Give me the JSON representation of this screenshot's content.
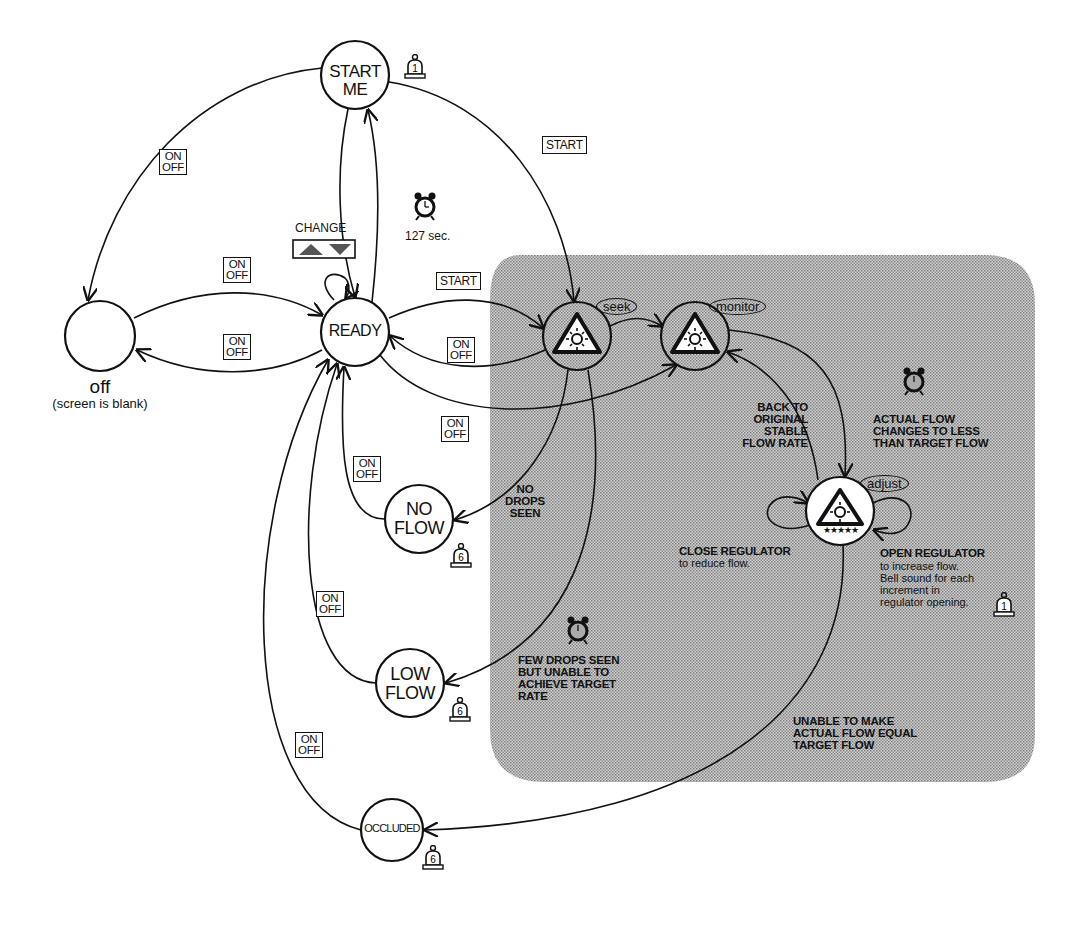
{
  "diagram": {
    "region": {
      "name": "active-control-region",
      "fill": "#bdbdbd"
    },
    "states": [
      {
        "id": "off",
        "label": "",
        "caption": "off",
        "subcaption": "(screen is blank)",
        "cx": 100,
        "cy": 336,
        "r": 35
      },
      {
        "id": "start_me",
        "label": "START\nME",
        "cx": 355,
        "cy": 75,
        "r": 34,
        "alarm": "1"
      },
      {
        "id": "ready",
        "label": "READY",
        "cx": 355,
        "cy": 332,
        "r": 34
      },
      {
        "id": "seek",
        "label": "",
        "tag": "seek",
        "cx": 577,
        "cy": 336,
        "r": 34,
        "icon": "light-triangle"
      },
      {
        "id": "monitor",
        "label": "",
        "tag": "monitor",
        "cx": 695,
        "cy": 336,
        "r": 34,
        "icon": "light-triangle"
      },
      {
        "id": "adjust",
        "label": "",
        "tag": "adjust",
        "cx": 840,
        "cy": 511,
        "r": 34,
        "icon": "light-triangle-stars",
        "stars": "★★★★★"
      },
      {
        "id": "no_flow",
        "label": "NO\nFLOW",
        "cx": 419,
        "cy": 519,
        "r": 34,
        "alarm": "6"
      },
      {
        "id": "low_flow",
        "label": "LOW\nFLOW",
        "cx": 410,
        "cy": 683,
        "r": 34,
        "alarm": "6"
      },
      {
        "id": "occluded",
        "label": "OCCLUDED",
        "cx": 392,
        "cy": 830,
        "r": 31,
        "alarm": "6"
      }
    ],
    "button_labels": {
      "on_off_top": "ON",
      "on_off_bottom": "OFF",
      "start": "START",
      "change": "CHANGE"
    },
    "timer": {
      "label": "127 sec."
    },
    "notes": {
      "no_drops": "NO\nDROPS\nSEEN",
      "few_drops": "FEW DROPS SEEN\nBUT UNABLE TO\nACHIEVE TARGET\nRATE",
      "back_to_original": "BACK TO\nORIGINAL\nSTABLE\nFLOW RATE",
      "actual_flow_changes": "ACTUAL FLOW\nCHANGES TO LESS\nTHAN TARGET FLOW",
      "close_regulator_title": "CLOSE REGULATOR",
      "close_regulator_body": "to reduce flow.",
      "open_regulator_title": "OPEN REGULATOR",
      "open_regulator_body": "to increase flow.\nBell sound for each\nincrement in\nregulator opening.",
      "unable_to_make": "UNABLE TO MAKE\nACTUAL FLOW EQUAL\nTARGET FLOW"
    },
    "alarm_counts": {
      "start_me": "1",
      "no_flow": "6",
      "low_flow": "6",
      "occluded": "6",
      "open_regulator": "1"
    },
    "transitions": [
      {
        "from": "start_me",
        "to": "off",
        "label": "ON/OFF"
      },
      {
        "from": "off",
        "to": "ready",
        "label": "ON/OFF"
      },
      {
        "from": "ready",
        "to": "off",
        "label": "ON/OFF"
      },
      {
        "from": "ready",
        "to": "ready",
        "label": "CHANGE"
      },
      {
        "from": "ready",
        "to": "start_me",
        "label": "127 sec."
      },
      {
        "from": "start_me",
        "to": "ready",
        "label": ""
      },
      {
        "from": "start_me",
        "to": "seek",
        "label": "START"
      },
      {
        "from": "ready",
        "to": "seek",
        "label": "START"
      },
      {
        "from": "seek",
        "to": "ready",
        "label": "ON/OFF"
      },
      {
        "from": "seek",
        "to": "monitor",
        "label": ""
      },
      {
        "from": "ready",
        "to": "monitor",
        "label": "ON/OFF"
      },
      {
        "from": "seek",
        "to": "no_flow",
        "label": "NO DROPS SEEN"
      },
      {
        "from": "seek",
        "to": "low_flow",
        "label": "FEW DROPS SEEN BUT UNABLE TO ACHIEVE TARGET RATE"
      },
      {
        "from": "no_flow",
        "to": "ready",
        "label": "ON/OFF"
      },
      {
        "from": "low_flow",
        "to": "ready",
        "label": "ON/OFF"
      },
      {
        "from": "occluded",
        "to": "ready",
        "label": "ON/OFF"
      },
      {
        "from": "monitor",
        "to": "adjust",
        "label": "ACTUAL FLOW CHANGES TO LESS THAN TARGET FLOW"
      },
      {
        "from": "adjust",
        "to": "monitor",
        "label": "BACK TO ORIGINAL STABLE FLOW RATE"
      },
      {
        "from": "adjust",
        "to": "adjust",
        "label": "CLOSE REGULATOR to reduce flow."
      },
      {
        "from": "adjust",
        "to": "adjust",
        "label": "OPEN REGULATOR to increase flow."
      },
      {
        "from": "adjust",
        "to": "occluded",
        "label": "UNABLE TO MAKE ACTUAL FLOW EQUAL TARGET FLOW"
      }
    ]
  }
}
